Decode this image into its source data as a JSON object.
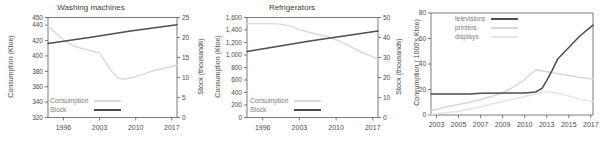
{
  "page": {
    "background": "#ffffff",
    "spine_color": "#5a5a5a",
    "text_color": "#4a4a4a"
  },
  "chart_data": [
    {
      "type": "line",
      "title": "Washing machines",
      "ylabel_left": "Consumption (Ktoe)",
      "ylabel_right": "Stock (thousands)",
      "xlim": [
        1993,
        2018
      ],
      "xticks": [
        {
          "v": 1996,
          "label": "1996"
        },
        {
          "v": 2003,
          "label": "2003"
        },
        {
          "v": 2010,
          "label": "2010"
        },
        {
          "v": 2017,
          "label": "2017"
        }
      ],
      "ylim_left": [
        320,
        450
      ],
      "yticks_left": [
        {
          "v": 320,
          "label": "320"
        },
        {
          "v": 340,
          "label": "340"
        },
        {
          "v": 360,
          "label": "360"
        },
        {
          "v": 380,
          "label": "380"
        },
        {
          "v": 400,
          "label": "400"
        },
        {
          "v": 420,
          "label": "420"
        },
        {
          "v": 440,
          "label": "440"
        },
        {
          "v": 450,
          "label": "450"
        }
      ],
      "ylim_right": [
        0,
        25
      ],
      "yticks_right": [
        {
          "v": 0,
          "label": "0"
        },
        {
          "v": 5,
          "label": "5"
        },
        {
          "v": 10,
          "label": "10"
        },
        {
          "v": 15,
          "label": "15"
        },
        {
          "v": 20,
          "label": "20"
        },
        {
          "v": 25,
          "label": "25"
        }
      ],
      "series": [
        {
          "name": "Consumption",
          "axis": "left",
          "color": "#dadada",
          "width": 1.4,
          "x": [
            1993,
            1996,
            1998,
            2000,
            2003,
            2005,
            2006.5,
            2008,
            2010,
            2013,
            2018
          ],
          "values": [
            439,
            421,
            413,
            409,
            404,
            383,
            371,
            370,
            373,
            380,
            388
          ]
        },
        {
          "name": "Stock",
          "axis": "right",
          "color": "#4d4d4d",
          "width": 1.5,
          "x": [
            1993,
            2001,
            2009,
            2018
          ],
          "values": [
            18.5,
            20,
            21.6,
            23.2
          ]
        }
      ],
      "legend": [
        {
          "label": "Consumption",
          "series": 0
        },
        {
          "label": "Stock",
          "series": 1
        }
      ]
    },
    {
      "type": "line",
      "title": "Refrigerators",
      "ylabel_left": "Consumption (Ktoe)",
      "ylabel_right": "Stock (thousands)",
      "xlim": [
        1993,
        2018
      ],
      "xticks": [
        {
          "v": 1996,
          "label": "1996"
        },
        {
          "v": 2003,
          "label": "2003"
        },
        {
          "v": 2010,
          "label": "2010"
        },
        {
          "v": 2017,
          "label": "2017"
        }
      ],
      "ylim_left": [
        0,
        1600
      ],
      "yticks_left": [
        {
          "v": 0,
          "label": "0"
        },
        {
          "v": 200,
          "label": "200"
        },
        {
          "v": 400,
          "label": "400"
        },
        {
          "v": 600,
          "label": "600"
        },
        {
          "v": 800,
          "label": "800"
        },
        {
          "v": 1000,
          "label": "1,000"
        },
        {
          "v": 1200,
          "label": "1,200"
        },
        {
          "v": 1400,
          "label": "1,400"
        },
        {
          "v": 1600,
          "label": "1,600"
        }
      ],
      "ylim_right": [
        0,
        50
      ],
      "yticks_right": [
        {
          "v": 0,
          "label": "0"
        },
        {
          "v": 10,
          "label": "10"
        },
        {
          "v": 20,
          "label": "20"
        },
        {
          "v": 30,
          "label": "30"
        },
        {
          "v": 40,
          "label": "40"
        },
        {
          "v": 50,
          "label": "50"
        }
      ],
      "series": [
        {
          "name": "Consumption",
          "axis": "left",
          "color": "#dadada",
          "width": 1.4,
          "x": [
            1993,
            1996,
            1999,
            2001,
            2003,
            2006,
            2009,
            2012,
            2015,
            2018
          ],
          "values": [
            1502,
            1502,
            1497,
            1470,
            1405,
            1340,
            1280,
            1165,
            1040,
            940
          ]
        },
        {
          "name": "Stock",
          "axis": "right",
          "color": "#4d4d4d",
          "width": 1.5,
          "x": [
            1993,
            2005,
            2018
          ],
          "values": [
            33,
            38.2,
            43.2
          ]
        }
      ],
      "legend": [
        {
          "label": "Consumption",
          "series": 0
        },
        {
          "label": "Stock",
          "series": 1
        }
      ]
    },
    {
      "type": "line",
      "title": "",
      "ylabel_left": "Consumption ( 1000's Ktoe)",
      "ylabel_right": "",
      "xlim": [
        2002.5,
        2017.2
      ],
      "xticks": [
        {
          "v": 2003,
          "label": "2003"
        },
        {
          "v": 2005,
          "label": "2005"
        },
        {
          "v": 2007,
          "label": "2007"
        },
        {
          "v": 2009,
          "label": "2009"
        },
        {
          "v": 2011,
          "label": "2010"
        },
        {
          "v": 2013,
          "label": "2013"
        },
        {
          "v": 2015,
          "label": "2015"
        },
        {
          "v": 2017,
          "label": "2017"
        }
      ],
      "ylim_left": [
        0,
        80
      ],
      "yticks_left": [
        {
          "v": 0,
          "label": "0"
        },
        {
          "v": 20,
          "label": "20"
        },
        {
          "v": 40,
          "label": "40"
        },
        {
          "v": 60,
          "label": "60"
        },
        {
          "v": 80,
          "label": "80"
        }
      ],
      "ylim_right": null,
      "yticks_right": [],
      "series": [
        {
          "name": "printers",
          "axis": "left",
          "color": "#d6d6d6",
          "width": 1.4,
          "x": [
            2002.5,
            2004,
            2006,
            2008,
            2009,
            2010,
            2011,
            2012,
            2013,
            2014,
            2015,
            2016,
            2017.2
          ],
          "values": [
            3.5,
            6.5,
            10,
            14.5,
            17.5,
            22,
            28,
            35.5,
            34,
            32.5,
            31,
            29.5,
            28
          ]
        },
        {
          "name": "displays",
          "axis": "left",
          "color": "#e4e4e4",
          "width": 1.4,
          "x": [
            2002.5,
            2005,
            2007,
            2009,
            2011,
            2012,
            2013,
            2014,
            2015,
            2016,
            2017.2
          ],
          "values": [
            0.5,
            3,
            6.5,
            10.5,
            14.5,
            16.5,
            18.5,
            17,
            15,
            12.5,
            10.5
          ]
        },
        {
          "name": "televisions",
          "axis": "left",
          "color": "#4d4d4d",
          "width": 1.5,
          "x": [
            2002.5,
            2006,
            2007,
            2011,
            2012,
            2012.6,
            2013,
            2013.5,
            2014,
            2015,
            2016,
            2017.2
          ],
          "values": [
            16.4,
            16.4,
            17,
            17.3,
            18,
            21,
            27,
            35,
            44,
            53,
            62,
            70.5
          ]
        }
      ],
      "legend": [
        {
          "label": "televisions",
          "series": 2
        },
        {
          "label": "printers",
          "series": 0
        },
        {
          "label": "displays",
          "series": 1
        }
      ]
    }
  ]
}
